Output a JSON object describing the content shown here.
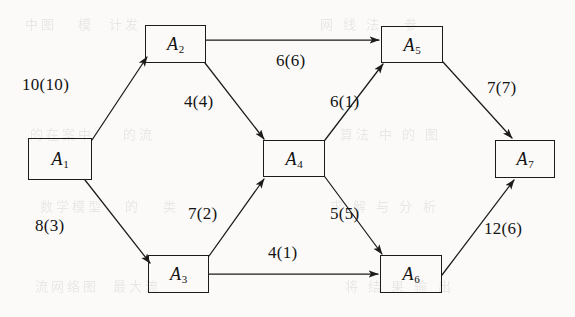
{
  "figure": {
    "kind": "network-flow-graph",
    "background_color": "#fbfaf8",
    "ink_color": "#1b1b1b",
    "label_format": "capacity(flow)"
  },
  "nodes": [
    {
      "id": "A1",
      "text": "A",
      "sub": "1",
      "x": 28,
      "y": 138,
      "w": 64,
      "h": 42
    },
    {
      "id": "A2",
      "text": "A",
      "sub": "2",
      "x": 145,
      "y": 25,
      "w": 61,
      "h": 38
    },
    {
      "id": "A3",
      "text": "A",
      "sub": "3",
      "x": 148,
      "y": 255,
      "w": 61,
      "h": 38
    },
    {
      "id": "A4",
      "text": "A",
      "sub": "4",
      "x": 263,
      "y": 140,
      "w": 62,
      "h": 37
    },
    {
      "id": "A5",
      "text": "A",
      "sub": "5",
      "x": 381,
      "y": 26,
      "w": 62,
      "h": 37
    },
    {
      "id": "A6",
      "text": "A",
      "sub": "6",
      "x": 380,
      "y": 255,
      "w": 62,
      "h": 38
    },
    {
      "id": "A7",
      "text": "A",
      "sub": "7",
      "x": 495,
      "y": 140,
      "w": 60,
      "h": 38
    }
  ],
  "edges": [
    {
      "id": "e-a1-a2",
      "from": "A1",
      "to": "A2",
      "capacity": 10,
      "flow": 10,
      "label": "10(10)",
      "label_x": 22,
      "label_y": 75,
      "x1": 92,
      "y1": 140,
      "x2": 147,
      "y2": 57
    },
    {
      "id": "e-a1-a3",
      "from": "A1",
      "to": "A3",
      "capacity": 8,
      "flow": 3,
      "label": "8(3)",
      "label_x": 35,
      "label_y": 216,
      "x1": 85,
      "y1": 180,
      "x2": 150,
      "y2": 263
    },
    {
      "id": "e-a2-a5",
      "from": "A2",
      "to": "A5",
      "capacity": 6,
      "flow": 6,
      "label": "6(6)",
      "label_x": 276,
      "label_y": 51,
      "x1": 206,
      "y1": 40,
      "x2": 379,
      "y2": 40
    },
    {
      "id": "e-a2-a4",
      "from": "A2",
      "to": "A4",
      "capacity": 4,
      "flow": 4,
      "label": "4(4)",
      "label_x": 184,
      "label_y": 92,
      "x1": 205,
      "y1": 63,
      "x2": 264,
      "y2": 139
    },
    {
      "id": "e-a3-a4",
      "from": "A3",
      "to": "A4",
      "capacity": 7,
      "flow": 2,
      "label": "7(2)",
      "label_x": 188,
      "label_y": 204,
      "x1": 209,
      "y1": 256,
      "x2": 264,
      "y2": 179
    },
    {
      "id": "e-a3-a6",
      "from": "A3",
      "to": "A6",
      "capacity": 4,
      "flow": 1,
      "label": "4(1)",
      "label_x": 268,
      "label_y": 243,
      "x1": 209,
      "y1": 274,
      "x2": 378,
      "y2": 274
    },
    {
      "id": "e-a4-a5",
      "from": "A4",
      "to": "A5",
      "capacity": 6,
      "flow": 1,
      "label": "6(1)",
      "label_x": 330,
      "label_y": 92,
      "x1": 325,
      "y1": 140,
      "x2": 383,
      "y2": 64
    },
    {
      "id": "e-a4-a6",
      "from": "A4",
      "to": "A6",
      "capacity": 5,
      "flow": 5,
      "label": "5(5)",
      "label_x": 330,
      "label_y": 204,
      "x1": 325,
      "y1": 177,
      "x2": 382,
      "y2": 254
    },
    {
      "id": "e-a5-a7",
      "from": "A5",
      "to": "A7",
      "capacity": 7,
      "flow": 7,
      "label": "7(7)",
      "label_x": 487,
      "label_y": 78,
      "x1": 443,
      "y1": 62,
      "x2": 512,
      "y2": 138
    },
    {
      "id": "e-a6-a7",
      "from": "A6",
      "to": "A7",
      "capacity": 12,
      "flow": 6,
      "label": "12(6)",
      "label_x": 484,
      "label_y": 219,
      "x1": 442,
      "y1": 275,
      "x2": 514,
      "y2": 180
    }
  ],
  "bleed_through_text": [
    {
      "text": "中图   模  计发",
      "x": 25,
      "y": 8
    },
    {
      "text": "的在案中    的流",
      "x": 30,
      "y": 118
    },
    {
      "text": "数学模型   的   类",
      "x": 40,
      "y": 190
    },
    {
      "text": "流网络图  最大流",
      "x": 35,
      "y": 270
    },
    {
      "text": "网 线 法   参",
      "x": 320,
      "y": 8
    },
    {
      "text": "算法 中 的 图",
      "x": 340,
      "y": 118
    },
    {
      "text": "求 解 与 分 析",
      "x": 330,
      "y": 190
    },
    {
      "text": "将 结 果 输 出",
      "x": 345,
      "y": 270
    }
  ]
}
